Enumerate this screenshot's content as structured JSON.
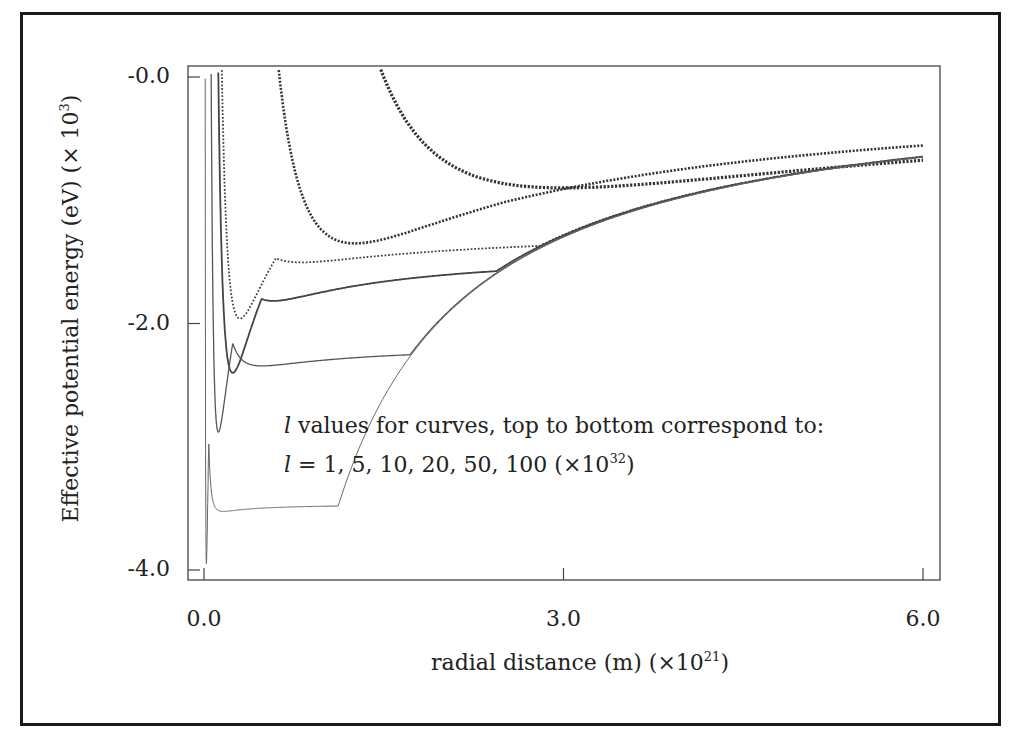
{
  "chart_data": {
    "type": "line",
    "title": "",
    "xlabel": "radial distance (m) (×10^21)",
    "ylabel": "Effective potential energy (eV) (× 10^3)",
    "xlim": [
      0.0,
      6.0
    ],
    "ylim": [
      -4.0,
      0.0
    ],
    "x_ticks": [
      "0.0",
      "3.0",
      "6.0"
    ],
    "y_ticks": [
      "-0.0",
      "-2.0",
      "-4.0"
    ],
    "grid": false,
    "legend_position": "none (annotation inside plot)",
    "annotation": [
      "l values for curves, top to bottom correspond to:",
      "l = 1, 5, 10, 20, 50, 100 (×10^32)"
    ],
    "series": [
      {
        "name": "l=100",
        "style": "dotted-heavy",
        "min_r": 3.0,
        "min_V": -0.9,
        "x": [
          1.1,
          1.5,
          2.0,
          3.0,
          4.0,
          5.0,
          6.0
        ],
        "y": [
          0.0,
          -0.55,
          -0.78,
          -0.9,
          -0.86,
          -0.78,
          -0.68
        ]
      },
      {
        "name": "l=50",
        "style": "dotted-medium",
        "min_r": 1.26,
        "min_V": -1.35,
        "x": [
          0.45,
          0.6,
          0.8,
          1.26,
          2.0,
          3.0,
          4.0,
          6.0
        ],
        "y": [
          0.0,
          -0.55,
          -1.0,
          -1.35,
          -1.22,
          -1.0,
          -0.85,
          -0.66
        ]
      },
      {
        "name": "l=20",
        "style": "dotted-light",
        "min_r": 0.3,
        "min_V": -1.96,
        "x": [
          0.12,
          0.2,
          0.3,
          0.6,
          1.0,
          2.0,
          4.0,
          6.0
        ],
        "y": [
          0.0,
          -1.6,
          -1.96,
          -1.75,
          -1.5,
          -1.1,
          -0.8,
          -0.64
        ]
      },
      {
        "name": "l=10",
        "style": "solid-medium",
        "min_r": 0.24,
        "min_V": -2.4,
        "x": [
          0.05,
          0.12,
          0.24,
          0.5,
          1.0,
          2.0,
          4.0,
          6.0
        ],
        "y": [
          0.0,
          -1.9,
          -2.4,
          -2.05,
          -1.55,
          -1.1,
          -0.8,
          -0.64
        ]
      },
      {
        "name": "l=5",
        "style": "solid-thin",
        "min_r": 0.12,
        "min_V": -2.88,
        "x": [
          0.02,
          0.06,
          0.12,
          0.3,
          1.0,
          2.0,
          4.0,
          6.0
        ],
        "y": [
          0.0,
          -2.3,
          -2.88,
          -2.4,
          -1.6,
          -1.12,
          -0.8,
          -0.64
        ]
      },
      {
        "name": "l=1",
        "style": "solid-hair",
        "min_r": 0.02,
        "min_V": -3.95,
        "x": [
          0.005,
          0.01,
          0.02,
          0.1,
          0.3,
          1.0,
          3.0,
          6.0
        ],
        "y": [
          0.0,
          -3.0,
          -3.95,
          -3.3,
          -2.6,
          -1.65,
          -1.0,
          -0.64
        ]
      }
    ]
  }
}
